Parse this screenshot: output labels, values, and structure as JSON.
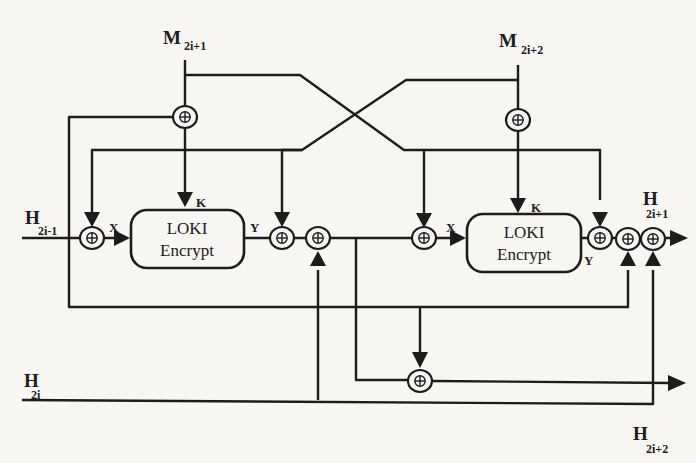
{
  "diagram": {
    "type": "block-diagram",
    "title": "",
    "ink_color": "#1c1c1c",
    "paper_color": "#f7f6f3",
    "inputs": {
      "m1": {
        "main": "M",
        "sub": "2i+1"
      },
      "m2": {
        "main": "M",
        "sub": "2i+2"
      },
      "h_prev_odd": {
        "main": "H",
        "sub": "2i-1"
      },
      "h_prev_even": {
        "main": "H",
        "sub": "2i"
      }
    },
    "outputs": {
      "h_next_odd": {
        "main": "H",
        "sub": "2i+1"
      },
      "h_next_even": {
        "main": "H",
        "sub": "2i+2"
      }
    },
    "blocks": [
      {
        "id": "loki1",
        "line1": "LOKI",
        "line2": "Encrypt",
        "key_port": "K",
        "in_port": "X",
        "out_port": "Y"
      },
      {
        "id": "loki2",
        "line1": "LOKI",
        "line2": "Encrypt",
        "key_port": "K",
        "in_port": "X",
        "out_port": "Y"
      }
    ],
    "operators": {
      "symbol": "⊕",
      "meaning": "XOR",
      "count": 10
    }
  }
}
